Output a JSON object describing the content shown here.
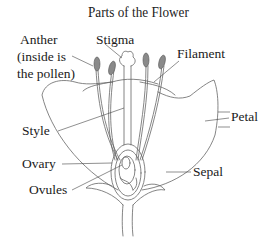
{
  "title": "Parts of the Flower",
  "labels": {
    "anther_line1": "Anther",
    "anther_line2": "(inside is",
    "anther_line3": "the pollen)",
    "stigma": "Stigma",
    "filament": "Filament",
    "petal": "Petal",
    "style": "Style",
    "ovary": "Ovary",
    "sepal": "Sepal",
    "ovules": "Ovules"
  },
  "colors": {
    "line": "#555555",
    "anther_fill": "#8a8a8a",
    "text": "#1a1a1a"
  }
}
